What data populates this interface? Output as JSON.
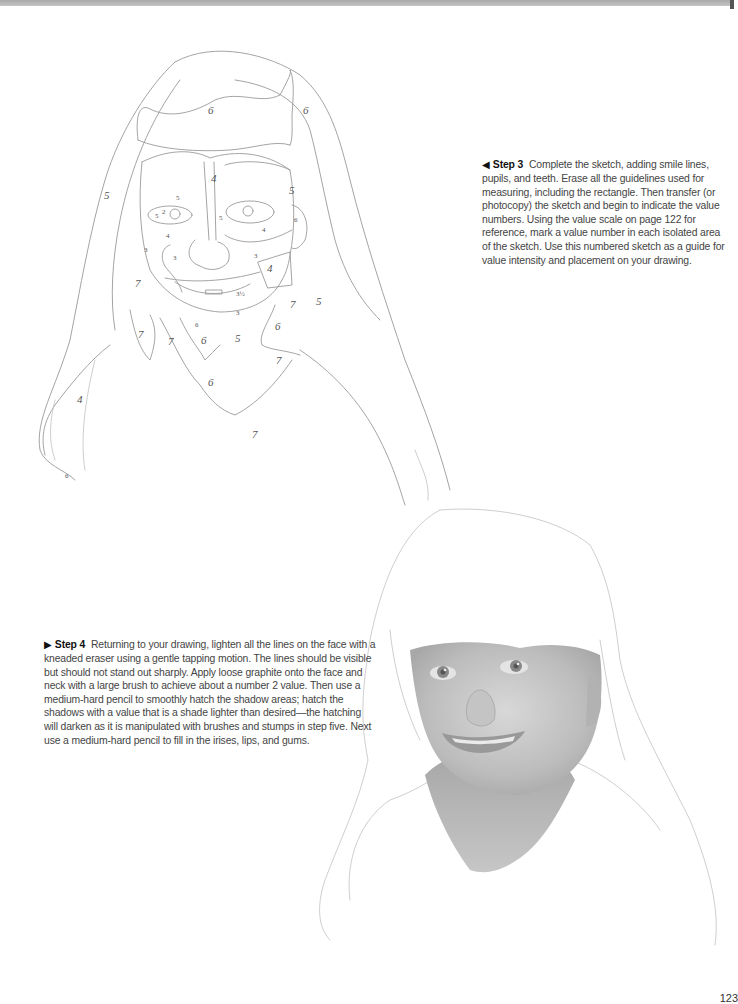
{
  "page": {
    "page_number": "123"
  },
  "step3": {
    "arrow": "◀",
    "label": "Step 3",
    "text": "Complete the sketch, adding smile lines, pupils, and teeth. Erase all the guidelines used for measuring, including the rectangle. Then transfer (or photocopy) the sketch and begin to indicate the value numbers. Using the value scale on page 122 for reference, mark a value number in each isolated area of the sketch. Use this numbered sketch as a guide for value intensity and placement on your drawing."
  },
  "step4": {
    "arrow": "▶",
    "label": "Step 4",
    "text": "Returning to your drawing, lighten all the lines on the face with a kneaded eraser using a gentle tapping motion. The lines should be visible but should not stand out sharply. Apply loose graphite onto the face and neck with a large brush to achieve about a number 2 value. Then use a medium-hard pencil to smoothly hatch the shadow areas; hatch the shadows with a value that is a shade lighter than desired—the hatching will darken as it is manipulated with brushes and stumps in step five. Next use a medium-hard pencil to fill in the irises, lips, and gums."
  },
  "sketch_values": {
    "hair_top": "6",
    "hair_top_right": "6",
    "bangs": "4",
    "hair_left": "5",
    "hair_right": "5",
    "brow_left": "5",
    "eye_left_a": "5",
    "eye_left_b": "2",
    "cheek_left": "4",
    "temple_left": "3",
    "cheek_left_low": "3",
    "eye_right_cheek": "4",
    "temple_right": "6",
    "nose_side": "5",
    "cheek_right": "3",
    "jaw_right": "4",
    "hair_left_low": "7",
    "hair_right_low": "7",
    "hair_right_outer": "5",
    "chin_side": "3½",
    "chin": "3",
    "neck_shadow_top": "6",
    "hair_inner_left": "7",
    "shoulder_left": "7",
    "neck_left": "6",
    "neck": "5",
    "neck_right": "6",
    "shoulder_right": "7",
    "neck_low": "6",
    "hair_far_left": "4",
    "shirt": "7",
    "hair_tip": "6"
  }
}
